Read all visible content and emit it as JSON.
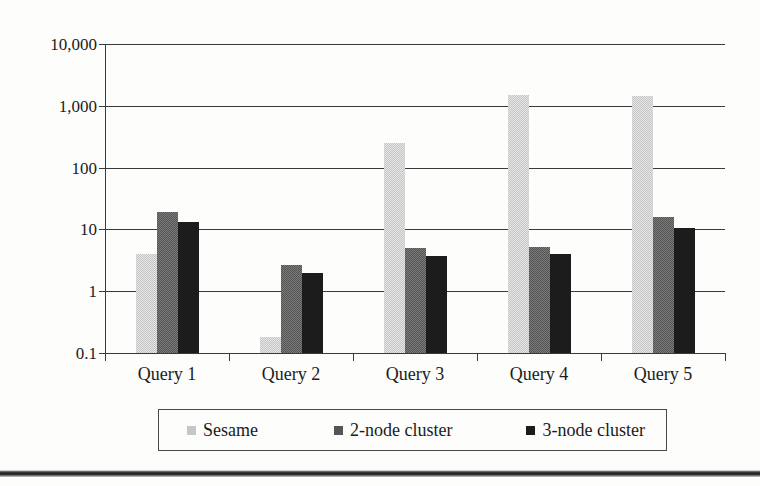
{
  "chart_data": {
    "type": "bar",
    "title": "",
    "subtitle": "",
    "xlabel": "",
    "ylabel": "",
    "scale": "log",
    "grid": true,
    "legend_position": "bottom",
    "categories": [
      "Query 1",
      "Query 2",
      "Query 3",
      "Query 4",
      "Query 5"
    ],
    "ytick_labels": [
      "10,000",
      "1,000",
      "100",
      "10",
      "1",
      "0.1"
    ],
    "ytick_values": [
      10000,
      1000,
      100,
      10,
      1,
      0.1
    ],
    "ylim": [
      0.1,
      10000
    ],
    "series": [
      {
        "name": "Sesame",
        "color": "#c6c6c6",
        "values": [
          4,
          0.18,
          250,
          1500,
          1450
        ]
      },
      {
        "name": "2-node cluster",
        "color": "#555555",
        "values": [
          19,
          2.7,
          5,
          5.2,
          16
        ]
      },
      {
        "name": "3-node cluster",
        "color": "#1c1c1c",
        "values": [
          13,
          2.0,
          3.7,
          4,
          10.5
        ]
      }
    ]
  },
  "legend": {
    "items": [
      {
        "label": "Sesame",
        "swatch": "legend-swatch-sesame"
      },
      {
        "label": "2-node cluster",
        "swatch": "legend-swatch-2-node"
      },
      {
        "label": "3-node cluster",
        "swatch": "legend-swatch-3-node"
      }
    ]
  }
}
